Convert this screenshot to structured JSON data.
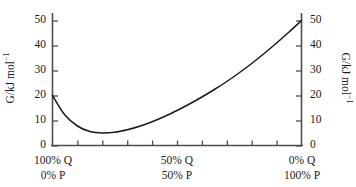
{
  "chart_data": {
    "type": "line",
    "title": "",
    "subtitle": "",
    "xlabel": "",
    "ylabel": "G/kJ mol⁻¹",
    "ylabel_right": "G/kJ mol⁻¹",
    "xlim": [
      0,
      100
    ],
    "ylim": [
      0,
      52
    ],
    "grid": false,
    "legend": null,
    "y_ticks": [
      0,
      10,
      20,
      30,
      40,
      50
    ],
    "y_tick_labels": [
      "0",
      "10",
      "20",
      "30",
      "40",
      "50"
    ],
    "y_ticks_right": [
      0,
      10,
      20,
      30,
      40,
      50
    ],
    "y_tick_labels_right": [
      "0",
      "10",
      "20",
      "30",
      "40",
      "50"
    ],
    "x_ticks": [
      0,
      10,
      20,
      30,
      40,
      50,
      60,
      70,
      80,
      90,
      100
    ],
    "x_tick_labels_major": [
      {
        "at": 0,
        "line1": "100% Q",
        "line2": "0% P"
      },
      {
        "at": 50,
        "line1": "50% Q",
        "line2": "50% P"
      },
      {
        "at": 100,
        "line1": "0% Q",
        "line2": "100% P"
      }
    ],
    "x": [
      0,
      5,
      10,
      15,
      20,
      25,
      30,
      35,
      40,
      45,
      50,
      55,
      60,
      65,
      70,
      75,
      80,
      85,
      90,
      95,
      100
    ],
    "series": [
      {
        "name": "G of mixture",
        "color": "#1a1a1a",
        "values": [
          20.0,
          12.2,
          7.8,
          5.6,
          5.0,
          5.3,
          6.3,
          7.7,
          9.5,
          11.6,
          14.0,
          16.6,
          19.4,
          22.4,
          25.6,
          29.1,
          32.8,
          36.8,
          41.0,
          45.4,
          50.0
        ]
      }
    ],
    "minimum": {
      "x": 20,
      "y": 5.0
    },
    "endpoints": {
      "left": 20.0,
      "right": 50.0
    }
  },
  "axes": {
    "y_left": {
      "title": "G/kJ mol",
      "title_sup": "−1",
      "labels": [
        "50",
        "40",
        "30",
        "20",
        "10",
        "0"
      ]
    },
    "y_right": {
      "title": "G/kJ mol",
      "title_sup": "−1",
      "labels": [
        "50",
        "40",
        "30",
        "20",
        "10",
        "0"
      ]
    },
    "x_bottom": {
      "groups": [
        {
          "line1": "100% Q",
          "line2": "0% P"
        },
        {
          "line1": "50% Q",
          "line2": "50% P"
        },
        {
          "line1": "0% Q",
          "line2": "100% P"
        }
      ]
    }
  },
  "colors": {
    "curve": "#1a1a1a",
    "axis": "#4d4d4d",
    "text": "#1a1a1a",
    "background": "#ffffff"
  }
}
